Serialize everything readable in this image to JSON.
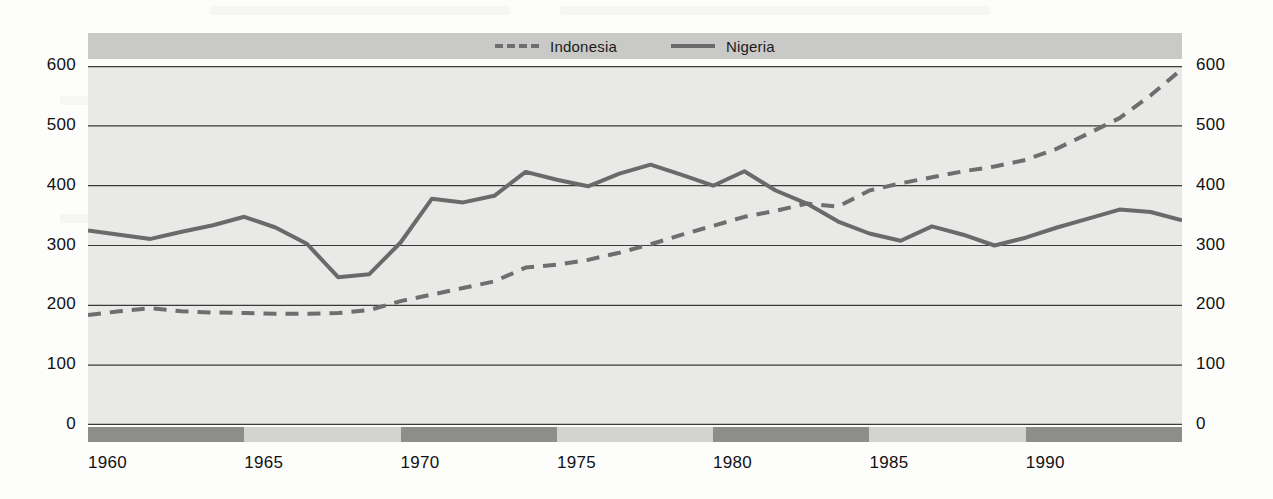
{
  "figure": {
    "kind": "line-chart",
    "plot_background": "#e9e9e7",
    "legend_band_background": "#c9c9c7",
    "band_dark": "#8d8d8b",
    "band_light": "#d3d3d1"
  },
  "legend": {
    "entries": [
      {
        "label": "Indonesia",
        "style": "dashed",
        "color": "#6e6e6e",
        "icon": "dashed-line-swatch-icon"
      },
      {
        "label": "Nigeria",
        "style": "solid",
        "color": "#6a6a6a",
        "icon": "solid-line-swatch-icon"
      }
    ]
  },
  "chart_data": {
    "type": "line",
    "title": "",
    "subtitle": "",
    "xlabel": "",
    "ylabel": "",
    "xlim": [
      1960,
      1995
    ],
    "ylim": [
      0,
      600
    ],
    "yticks": [
      0,
      100,
      200,
      300,
      400,
      500,
      600
    ],
    "ytick_labels": [
      "0",
      "100",
      "200",
      "300",
      "400",
      "500",
      "600"
    ],
    "ytick_labels_left": [
      "600",
      "500",
      "400",
      "300",
      "200",
      "100",
      "0"
    ],
    "ytick_labels_right": [
      "600",
      "500",
      "400",
      "300",
      "200",
      "100",
      "0"
    ],
    "xticks": [
      1960,
      1965,
      1970,
      1975,
      1980,
      1985,
      1990
    ],
    "xtick_labels": [
      "1960",
      "1965",
      "1970",
      "1975",
      "1980",
      "1985",
      "1990"
    ],
    "grid": true,
    "grid_axis": "y",
    "legend_position": "top-center",
    "x": [
      1960,
      1961,
      1962,
      1963,
      1964,
      1965,
      1966,
      1967,
      1968,
      1969,
      1970,
      1971,
      1972,
      1973,
      1974,
      1975,
      1976,
      1977,
      1978,
      1979,
      1980,
      1981,
      1982,
      1983,
      1984,
      1985,
      1986,
      1987,
      1988,
      1989,
      1990,
      1991,
      1992,
      1993,
      1994,
      1995
    ],
    "series": [
      {
        "name": "Indonesia",
        "style": "dashed",
        "color": "#6e6e6e",
        "values": [
          184,
          190,
          195,
          190,
          188,
          187,
          186,
          186,
          187,
          192,
          207,
          218,
          229,
          240,
          263,
          268,
          276,
          288,
          302,
          318,
          333,
          348,
          358,
          370,
          365,
          392,
          404,
          414,
          424,
          432,
          443,
          462,
          487,
          513,
          551,
          595
        ]
      },
      {
        "name": "Nigeria",
        "style": "solid",
        "color": "#6a6a6a",
        "values": [
          325,
          318,
          311,
          323,
          334,
          348,
          330,
          303,
          247,
          252,
          305,
          378,
          372,
          383,
          423,
          410,
          399,
          420,
          435,
          418,
          400,
          424,
          392,
          370,
          340,
          320,
          308,
          332,
          318,
          300,
          313,
          330,
          345,
          360,
          356,
          342
        ]
      }
    ],
    "annotations": []
  },
  "xband_segments": [
    {
      "from": 1960,
      "to": 1965,
      "shade": "dark"
    },
    {
      "from": 1965,
      "to": 1970,
      "shade": "light"
    },
    {
      "from": 1970,
      "to": 1975,
      "shade": "dark"
    },
    {
      "from": 1975,
      "to": 1980,
      "shade": "light"
    },
    {
      "from": 1980,
      "to": 1985,
      "shade": "dark"
    },
    {
      "from": 1985,
      "to": 1990,
      "shade": "light"
    },
    {
      "from": 1990,
      "to": 1995,
      "shade": "dark"
    }
  ]
}
